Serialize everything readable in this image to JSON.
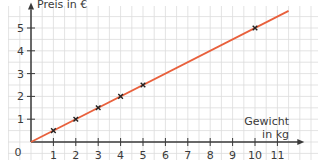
{
  "chart_data": {
    "type": "line",
    "title": "",
    "xlabel": "Gewicht in kg",
    "xlabel_lines": [
      "Gewicht",
      "in kg"
    ],
    "ylabel": "Preis in €",
    "origin_label": "0",
    "x_ticks": [
      1,
      2,
      3,
      4,
      5,
      6,
      7,
      8,
      9,
      10,
      11
    ],
    "y_ticks": [
      1,
      2,
      3,
      4,
      5
    ],
    "xlim": [
      0,
      11.8
    ],
    "ylim": [
      0,
      5.9
    ],
    "grid": true,
    "grid_step": 0.5,
    "series": [
      {
        "name": "Preis",
        "color": "#e8603c",
        "line": {
          "x": [
            0,
            11.5
          ],
          "y": [
            0,
            5.75
          ]
        },
        "points": [
          {
            "x": 1,
            "y": 0.5
          },
          {
            "x": 2,
            "y": 1
          },
          {
            "x": 3,
            "y": 1.5
          },
          {
            "x": 4,
            "y": 2
          },
          {
            "x": 5,
            "y": 2.5
          },
          {
            "x": 10,
            "y": 5
          }
        ],
        "marker": "x"
      }
    ]
  },
  "colors": {
    "line": "#e8603c",
    "axis": "#3a3a3a",
    "grid": "#dcdcdc",
    "marker": "#222222"
  }
}
